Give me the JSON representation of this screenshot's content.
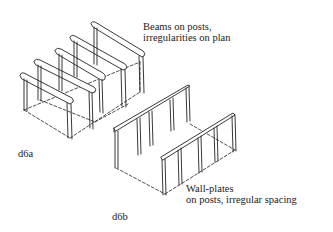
{
  "figures": [
    {
      "id": "d6a",
      "label": "d6a",
      "caption_line1": "Beams on posts,",
      "caption_line2": "irregularities on plan"
    },
    {
      "id": "d6b",
      "label": "d6b",
      "caption_line1": "Wall-plates",
      "caption_line2": "on posts, irregular spacing"
    }
  ],
  "colors": {
    "ink": "#222222",
    "background": "#ffffff"
  }
}
